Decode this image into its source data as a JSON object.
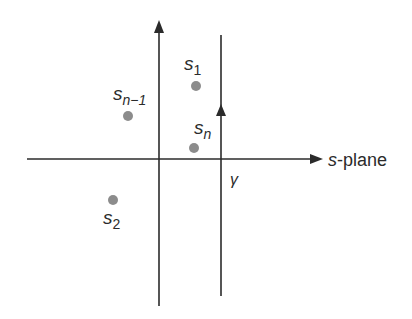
{
  "diagram": {
    "title": "s-plane",
    "axis_label": "s-plane",
    "contour_label": "γ",
    "points": [
      {
        "name": "s_1",
        "base": "s",
        "sub": "1",
        "x": 196,
        "y": 86
      },
      {
        "name": "s_2",
        "base": "s",
        "sub": "2",
        "x": 113,
        "y": 200
      },
      {
        "name": "s_n-1",
        "base": "s",
        "sub": "n−1",
        "x": 128,
        "y": 116
      },
      {
        "name": "s_n",
        "base": "s",
        "sub": "n",
        "x": 194,
        "y": 148
      }
    ],
    "colors": {
      "line": "#2b2b2b",
      "point": "#8c8c8c"
    }
  }
}
